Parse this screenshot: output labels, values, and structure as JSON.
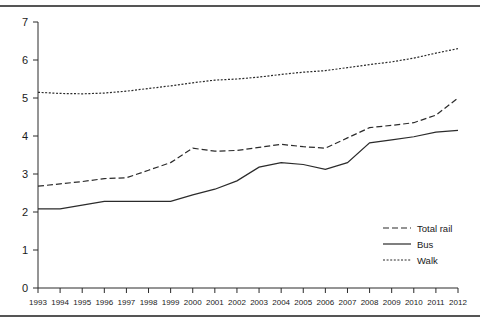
{
  "page": {
    "background_color": "#ffffff",
    "rule_color": "#555555",
    "line_color": "#2b2b2b"
  },
  "chart_data": {
    "type": "line",
    "title": "",
    "subtitle": "",
    "xlabel": "",
    "ylabel": "",
    "xlim": [
      1993,
      2012
    ],
    "ylim": [
      0,
      7
    ],
    "grid": false,
    "legend_position": "inside-bottom-right",
    "x": [
      1993,
      1994,
      1995,
      1996,
      1997,
      1998,
      1999,
      2000,
      2001,
      2002,
      2003,
      2004,
      2005,
      2006,
      2007,
      2008,
      2009,
      2010,
      2011,
      2012
    ],
    "xtick_labels": [
      "1993",
      "1994",
      "1995",
      "1996",
      "1997",
      "1998",
      "1999",
      "2000",
      "2001",
      "2002",
      "2003",
      "2004",
      "2005",
      "2006",
      "2007",
      "2008",
      "2009",
      "2010",
      "2011",
      "2012"
    ],
    "ytick_labels": [
      "0",
      "1",
      "2",
      "3",
      "4",
      "5",
      "6",
      "7"
    ],
    "yticks": [
      0,
      1,
      2,
      3,
      4,
      5,
      6,
      7
    ],
    "series": [
      {
        "name": "Walk",
        "style": "dotted",
        "color": "#2b2b2b",
        "values": [
          5.15,
          5.12,
          5.11,
          5.13,
          5.18,
          5.25,
          5.32,
          5.4,
          5.47,
          5.5,
          5.55,
          5.62,
          5.68,
          5.72,
          5.8,
          5.88,
          5.95,
          6.05,
          6.18,
          6.3
        ]
      },
      {
        "name": "Total rail",
        "style": "dashed",
        "color": "#2b2b2b",
        "values": [
          2.68,
          2.74,
          2.8,
          2.88,
          2.9,
          3.1,
          3.3,
          3.68,
          3.6,
          3.62,
          3.7,
          3.78,
          3.72,
          3.68,
          3.95,
          4.22,
          4.28,
          4.35,
          4.55,
          5.0
        ]
      },
      {
        "name": "Bus",
        "style": "solid",
        "color": "#2b2b2b",
        "values": [
          2.08,
          2.08,
          2.18,
          2.28,
          2.28,
          2.28,
          2.28,
          2.45,
          2.6,
          2.82,
          3.18,
          3.3,
          3.25,
          3.12,
          3.3,
          3.82,
          3.9,
          3.98,
          4.1,
          4.15
        ]
      }
    ],
    "legend": [
      {
        "label": "Total rail",
        "style": "dashed"
      },
      {
        "label": "Bus",
        "style": "solid"
      },
      {
        "label": "Walk",
        "style": "dotted"
      }
    ]
  }
}
